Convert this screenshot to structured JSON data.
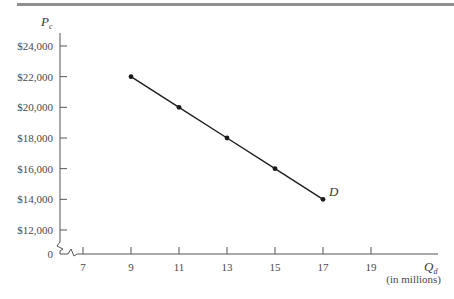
{
  "chart_data": {
    "type": "line",
    "title": "",
    "xlabel": "Q_d",
    "xlabel_note": "(in millions)",
    "ylabel": "P_c",
    "x_ticks": [
      7,
      9,
      11,
      13,
      15,
      17,
      19
    ],
    "y_ticks": [
      "$12,000",
      "$14,000",
      "$16,000",
      "$18,000",
      "$20,000",
      "$22,000",
      "$24,000"
    ],
    "y_tick_values": [
      12000,
      14000,
      16000,
      18000,
      20000,
      22000,
      24000
    ],
    "origin_label": "0",
    "axis_breaks": [
      "x",
      "y"
    ],
    "grid": false,
    "legend": false,
    "xlim": [
      7,
      19
    ],
    "ylim": [
      12000,
      24000
    ],
    "series": [
      {
        "name": "D",
        "x": [
          9,
          11,
          13,
          15,
          17
        ],
        "y": [
          22000,
          20000,
          18000,
          16000,
          14000
        ],
        "markers": true,
        "label_at_end": "D"
      }
    ],
    "colors": {
      "line": "#1a1a1a",
      "axis": "#555555",
      "top_rule": "#8a8a8a"
    }
  }
}
